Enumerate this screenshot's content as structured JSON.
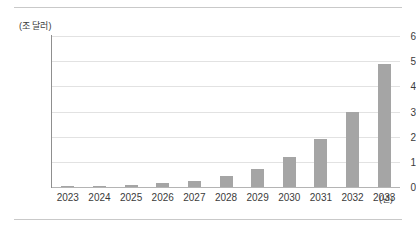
{
  "chart_data": {
    "type": "bar",
    "title": "",
    "subtitle": "",
    "xlabel": "(년)",
    "ylabel": "(조 달러)",
    "categories": [
      "2023",
      "2024",
      "2025",
      "2026",
      "2027",
      "2028",
      "2029",
      "2030",
      "2031",
      "2032",
      "2033"
    ],
    "values": [
      0.03,
      0.05,
      0.08,
      0.15,
      0.25,
      0.42,
      0.72,
      1.2,
      1.9,
      3.0,
      4.9
    ],
    "series": [
      {
        "name": "시장 규모",
        "values": [
          0.03,
          0.05,
          0.08,
          0.15,
          0.25,
          0.42,
          0.72,
          1.2,
          1.9,
          3.0,
          4.9
        ]
      }
    ],
    "ylim": [
      0,
      6
    ],
    "yticks": [
      0,
      1,
      2,
      3,
      4,
      5,
      6
    ],
    "ytick_labels": [
      "0",
      "1",
      "2",
      "3",
      "4",
      "5",
      "6"
    ],
    "grid": true,
    "legend": false,
    "legend_position": "none",
    "bar_color": "#a5a5a5",
    "gridline_color": "#e2e2e2",
    "axis_color": "#8f8f8f",
    "text_color": "#3b3b3b",
    "background": "#ffffff"
  }
}
